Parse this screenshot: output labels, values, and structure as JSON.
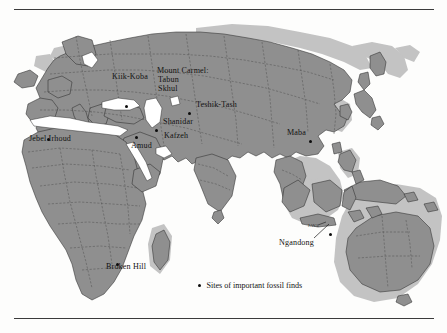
{
  "figure": {
    "type": "map",
    "title_visible": false,
    "projection_note": "Old World plus Australia, lighter gray tone marks exposed continental shelf / lowered sea level"
  },
  "colors": {
    "land": "#8f8f8f",
    "land_dark": "#7c7c7c",
    "shelf": "#c3c3c3",
    "sea": "#ffffff",
    "border_line": "#4a4a4a",
    "coast_line": "#2e2e2e",
    "rule": "#3b3b3b",
    "dot": "#0c0c0c",
    "label_text": "#121212"
  },
  "rules": {
    "top": "horizontal-rule",
    "bottom": "horizontal-rule"
  },
  "legend": {
    "marker": "filled-circle",
    "text": "Sites of important fossil finds"
  },
  "region_labels": [
    {
      "name": "java",
      "text": "JAVA",
      "x": 309,
      "y": 222
    }
  ],
  "sites": [
    {
      "name": "kiik-koba",
      "label": "Kiik-Koba",
      "label_x": 112,
      "label_y": 72,
      "dot_x": 127,
      "dot_y": 95
    },
    {
      "name": "mount-carmel",
      "label": "Mount Carmel:",
      "label_x": 157,
      "label_y": 66,
      "dot_x": null,
      "dot_y": null
    },
    {
      "name": "tabun",
      "label": "Tabun",
      "label_x": 158,
      "label_y": 75,
      "dot_x": null,
      "dot_y": null
    },
    {
      "name": "skhul",
      "label": "Skhul",
      "label_x": 158,
      "label_y": 84,
      "dot_x": null,
      "dot_y": null
    },
    {
      "name": "teshik-tash",
      "label": "Teshik-Tash",
      "label_x": 197,
      "label_y": 100,
      "dot_x": 190,
      "dot_y": 102
    },
    {
      "name": "shanidar",
      "label": "Shanidar",
      "label_x": 164,
      "label_y": 117,
      "dot_x": 157,
      "dot_y": 119
    },
    {
      "name": "kafzeh",
      "label": "Kafzeh",
      "label_x": 165,
      "label_y": 131,
      "dot_x": null,
      "dot_y": null
    },
    {
      "name": "amud",
      "label": "Amud",
      "label_x": 132,
      "label_y": 141,
      "dot_x": 137,
      "dot_y": 126
    },
    {
      "name": "jebel-irhoud",
      "label": "Jebel Irhoud",
      "label_x": 29,
      "label_y": 134,
      "dot_x": 49,
      "dot_y": 128
    },
    {
      "name": "maba",
      "label": "Maba",
      "label_x": 288,
      "label_y": 128,
      "dot_x": 311,
      "dot_y": 130
    },
    {
      "name": "broken-hill",
      "label": "Broken Hill",
      "label_x": 107,
      "label_y": 262,
      "dot_x": 118,
      "dot_y": 253
    },
    {
      "name": "ngandong",
      "label": "Ngandong",
      "label_x": 279,
      "label_y": 239,
      "dot_x": 331,
      "dot_y": 223
    }
  ]
}
